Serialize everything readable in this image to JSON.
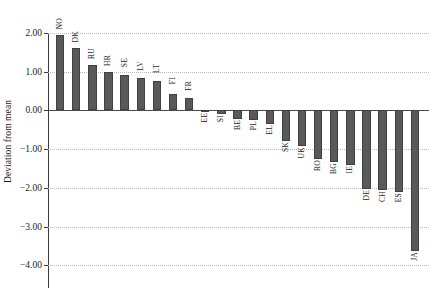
{
  "chart_data": {
    "type": "bar",
    "title": "",
    "xlabel": "",
    "ylabel": "Deviation from mean",
    "ylim": [
      -4.0,
      2.2
    ],
    "yticks": [
      "2.00",
      "1.00",
      "0.00",
      "-1.00",
      "-2.00",
      "-3.00",
      "-4.00"
    ],
    "ytick_values": [
      2.0,
      1.0,
      0.0,
      -1.0,
      -2.0,
      -3.0,
      -4.0
    ],
    "grid": "horizontal-dotted",
    "legend": "none",
    "bar_color": "#595959",
    "bar_edge_color": "#404040",
    "categories": [
      "NO",
      "DK",
      "RU",
      "HR",
      "SE",
      "LV",
      "LT",
      "FI",
      "FR",
      "EE",
      "SI",
      "BE",
      "PL",
      "EL",
      "SK",
      "UK",
      "RO",
      "BG",
      "IE",
      "DE",
      "CH",
      "ES",
      "JA"
    ],
    "values": [
      1.94,
      1.6,
      1.18,
      1.0,
      0.91,
      0.83,
      0.76,
      0.42,
      0.33,
      -0.04,
      -0.09,
      -0.23,
      -0.26,
      -0.34,
      -0.78,
      -0.92,
      -1.26,
      -1.33,
      -1.42,
      -2.02,
      -2.06,
      -2.1,
      -3.63
    ]
  }
}
